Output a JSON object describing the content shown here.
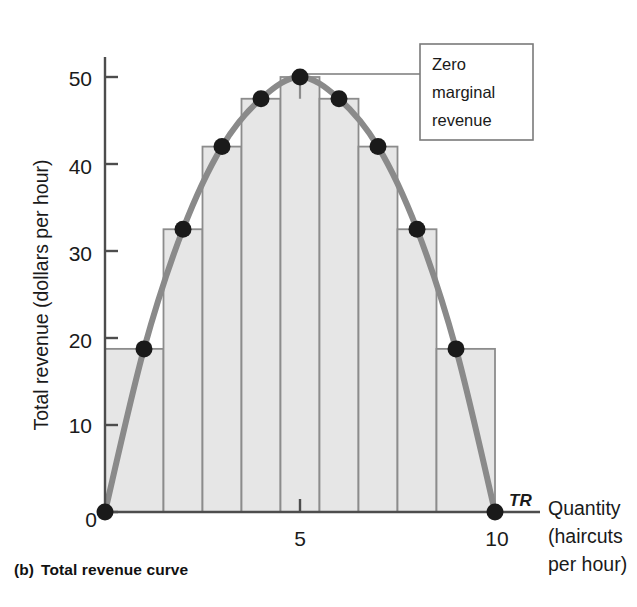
{
  "figure": {
    "caption_letter": "(b)",
    "caption_text": "Total revenue curve"
  },
  "colors": {
    "curve": "#8a8a8a",
    "bar_fill": "#e6e6e6",
    "bar_stroke": "#8c8c8c",
    "axis": "#4d4d4d",
    "point": "#1a1a1a",
    "callout_border": "#7a7a7a",
    "text": "#1a1a1a"
  },
  "axes": {
    "y_title": "Total revenue (dollars per hour)",
    "y_ticks": [
      "0",
      "10",
      "20",
      "30",
      "40",
      "50"
    ],
    "x_ticks": [
      "0",
      "5",
      "10"
    ],
    "x_title_line1": "Quantity",
    "x_title_line2": "(haircuts",
    "x_title_line3": "per hour)"
  },
  "annotations": {
    "curve_label": "TR",
    "callout_line1": "Zero",
    "callout_line2": "marginal",
    "callout_line3": "revenue"
  },
  "chart_data": {
    "type": "line",
    "title": "Total revenue curve",
    "xlabel": "Quantity (haircuts per hour)",
    "ylabel": "Total revenue (dollars per hour)",
    "xlim": [
      0,
      10
    ],
    "ylim": [
      0,
      52
    ],
    "grid": false,
    "legend": "none",
    "series": [
      {
        "name": "TR",
        "x": [
          0,
          1,
          2,
          3,
          4,
          5,
          6,
          7,
          8,
          9,
          10
        ],
        "values": [
          0,
          18.75,
          32.5,
          42,
          47.5,
          50,
          47.5,
          42,
          32.5,
          18.75,
          0
        ]
      }
    ],
    "marked_points": [
      {
        "x": 0,
        "y": 0
      },
      {
        "x": 1,
        "y": 18.75
      },
      {
        "x": 2,
        "y": 32.5
      },
      {
        "x": 3,
        "y": 42
      },
      {
        "x": 4,
        "y": 47.5
      },
      {
        "x": 5,
        "y": 50
      },
      {
        "x": 6,
        "y": 47.5
      },
      {
        "x": 7,
        "y": 42
      },
      {
        "x": 8,
        "y": 32.5
      },
      {
        "x": 9,
        "y": 18.75
      },
      {
        "x": 10,
        "y": 0
      }
    ],
    "bars": [
      {
        "x_start": 0,
        "x_end": 1.5,
        "height": 18.75
      },
      {
        "x_start": 1.5,
        "x_end": 2.5,
        "height": 32.5
      },
      {
        "x_start": 2.5,
        "x_end": 3.5,
        "height": 42
      },
      {
        "x_start": 3.5,
        "x_end": 4.5,
        "height": 47.5
      },
      {
        "x_start": 4.5,
        "x_end": 5.5,
        "height": 50
      },
      {
        "x_start": 5.5,
        "x_end": 6.5,
        "height": 47.5
      },
      {
        "x_start": 6.5,
        "x_end": 7.5,
        "height": 42
      },
      {
        "x_start": 7.5,
        "x_end": 8.5,
        "height": 32.5
      },
      {
        "x_start": 8.5,
        "x_end": 10,
        "height": 18.75
      }
    ],
    "annotation_note": "Zero marginal revenue at the peak of the total revenue curve (Q = 5, TR = 50)"
  }
}
